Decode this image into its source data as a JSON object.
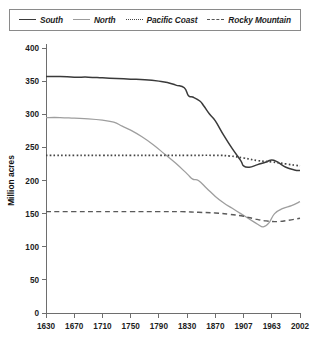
{
  "legend": {
    "position": "top",
    "items": [
      {
        "label": "South",
        "style": "solid",
        "color": "#3a3a3a",
        "icon": "line-swatch-icon"
      },
      {
        "label": "North",
        "style": "solid",
        "color": "#9e9e9e",
        "icon": "line-swatch-icon"
      },
      {
        "label": "Pacific Coast",
        "style": "dotted",
        "color": "#434343",
        "icon": "line-swatch-icon"
      },
      {
        "label": "Rocky Mountain",
        "style": "dashed",
        "color": "#5a5a5a",
        "icon": "line-swatch-icon"
      }
    ]
  },
  "axes": {
    "ylabel": "Million acres",
    "yticks": [
      "400",
      "350",
      "300",
      "250",
      "200",
      "150",
      "100",
      "50",
      "0"
    ],
    "xticks": [
      "1630",
      "1670",
      "1710",
      "1750",
      "1790",
      "1830",
      "1870",
      "1907",
      "1963",
      "2002"
    ]
  },
  "chart_data": {
    "type": "line",
    "title": "",
    "xlabel": "",
    "ylabel": "Million acres",
    "ylim": [
      0,
      400
    ],
    "grid": false,
    "legend_position": "top",
    "categories": [
      "1630",
      "1670",
      "1710",
      "1750",
      "1790",
      "1830",
      "1870",
      "1907",
      "1963",
      "2002"
    ],
    "x_positions": [
      0,
      1,
      2,
      3,
      4,
      5,
      6,
      7,
      8,
      9
    ],
    "series": [
      {
        "name": "South",
        "style": "solid",
        "color": "#3a3a3a",
        "values": [
          357,
          356,
          355,
          353,
          350,
          335,
          290,
          232,
          220,
          215
        ],
        "detail_x": [
          0,
          0.5,
          1,
          1.5,
          2,
          2.5,
          3,
          3.5,
          4,
          4.3,
          4.6,
          4.9,
          5.05,
          5.2,
          5.45,
          5.6,
          5.8,
          6,
          6.3,
          6.6,
          6.9,
          7.0,
          7.2,
          7.5,
          7.8,
          8.0,
          8.2,
          8.5,
          8.8,
          9
        ],
        "detail_y": [
          357,
          357,
          356,
          356,
          355,
          354,
          353,
          352,
          350,
          348,
          344,
          340,
          328,
          326,
          320,
          312,
          300,
          290,
          268,
          248,
          230,
          222,
          220,
          224,
          228,
          231,
          228,
          220,
          216,
          215
        ]
      },
      {
        "name": "North",
        "style": "solid",
        "color": "#9e9e9e",
        "values": [
          295,
          294,
          292,
          289,
          280,
          250,
          200,
          150,
          140,
          168
        ],
        "detail_x": [
          0,
          0.5,
          1,
          1.5,
          2,
          2.4,
          2.7,
          3,
          3.4,
          3.8,
          4.2,
          4.6,
          5.0,
          5.2,
          5.4,
          5.7,
          6.0,
          6.3,
          6.6,
          6.9,
          7.2,
          7.5,
          7.7,
          7.9,
          8.1,
          8.4,
          8.7,
          9
        ],
        "detail_y": [
          295,
          295,
          294,
          293,
          291,
          288,
          282,
          276,
          266,
          254,
          240,
          226,
          210,
          202,
          200,
          188,
          176,
          166,
          158,
          150,
          142,
          134,
          130,
          136,
          150,
          158,
          162,
          168
        ]
      },
      {
        "name": "Pacific Coast",
        "style": "dotted",
        "color": "#434343",
        "values": [
          238,
          238,
          238,
          238,
          238,
          238,
          238,
          236,
          228,
          222
        ],
        "detail_x": [
          0,
          1,
          2,
          3,
          4,
          5,
          6,
          6.5,
          7,
          7.5,
          8,
          8.5,
          9
        ],
        "detail_y": [
          238,
          238,
          238,
          238,
          238,
          238,
          238,
          237,
          234,
          230,
          228,
          225,
          222
        ]
      },
      {
        "name": "Rocky Mountain",
        "style": "dashed",
        "color": "#5a5a5a",
        "values": [
          153,
          153,
          153,
          153,
          153,
          152,
          150,
          145,
          138,
          143
        ],
        "detail_x": [
          0,
          1,
          2,
          3,
          4,
          4.8,
          5.4,
          6,
          6.5,
          7,
          7.4,
          7.8,
          8.2,
          8.6,
          9
        ],
        "detail_y": [
          153,
          153,
          153,
          153,
          153,
          153,
          152,
          151,
          149,
          146,
          142,
          139,
          138,
          140,
          143
        ]
      }
    ]
  }
}
